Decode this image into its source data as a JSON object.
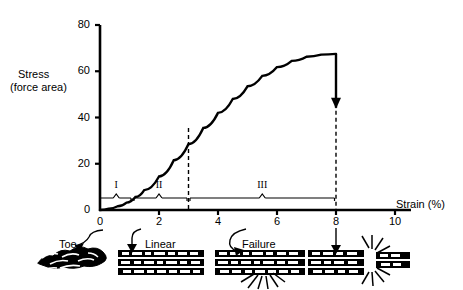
{
  "chart_data": {
    "type": "line",
    "title": "",
    "xlabel": "Strain (%)",
    "ylabel": "Stress (force area)",
    "ylabel_line1": "Stress",
    "ylabel_line2": "(force area)",
    "xlim": [
      0,
      10
    ],
    "ylim": [
      0,
      80
    ],
    "xticks": [
      "0",
      "2",
      "4",
      "6",
      "8",
      "10"
    ],
    "xtick_values": [
      0,
      2,
      4,
      6,
      8,
      10
    ],
    "yticks": [
      "0",
      "20",
      "40",
      "60",
      "80"
    ],
    "ytick_values": [
      0,
      20,
      40,
      60,
      80
    ],
    "grid": false,
    "legend": "none",
    "series": [
      {
        "name": "Stress-strain curve",
        "x": [
          0,
          0.3,
          0.6,
          0.9,
          1.2,
          1.5,
          2.0,
          2.5,
          3.0,
          3.5,
          4.0,
          4.5,
          5.0,
          5.5,
          6.0,
          6.5,
          7.0,
          7.5,
          8.0
        ],
        "values": [
          0,
          0.6,
          1.6,
          3.2,
          5.6,
          8.6,
          14.5,
          21.5,
          28.5,
          35.5,
          42.0,
          48.0,
          53.5,
          58.0,
          61.8,
          64.5,
          66.3,
          67.2,
          67.5
        ]
      }
    ],
    "annotations": [
      {
        "name": "failure-drop-arrow",
        "type": "arrow",
        "x": 8,
        "y_from": 67.5,
        "y_to": 46,
        "direction": "down"
      },
      {
        "name": "dashed-line-region-ii-iii",
        "type": "vline",
        "x": 3,
        "y_top": 35.5,
        "y_bottom": 0,
        "style": "dashed"
      },
      {
        "name": "dashed-line-failure",
        "type": "vline",
        "x": 8,
        "y_top": 46,
        "y_bottom": 0,
        "style": "dashed"
      }
    ],
    "regions": [
      {
        "label": "I",
        "x_start": 0.0,
        "x_end": 1.05,
        "center": 0.55
      },
      {
        "label": "II",
        "x_start": 1.15,
        "x_end": 2.95,
        "center": 2.0
      },
      {
        "label": "III",
        "x_start": 3.05,
        "x_end": 7.95,
        "center": 5.5
      }
    ]
  },
  "axis": {
    "y_title_line1": "Stress",
    "y_title_line2": "(force area)",
    "x_title": "Strain (%)"
  },
  "illustrations": [
    {
      "name": "toe-fiber",
      "label": "Toe",
      "description": "crimped wavy collagen fibers"
    },
    {
      "name": "linear-fiber",
      "label": "Linear",
      "description": "straightened parallel fibers"
    },
    {
      "name": "failure-fiber",
      "label": "Failure",
      "description": "fibers with localized burst damage"
    },
    {
      "name": "rupture-fiber",
      "label": "",
      "description": "fully ruptured fiber bundle"
    }
  ],
  "colors": {
    "foreground": "#000000",
    "background": "#ffffff"
  }
}
